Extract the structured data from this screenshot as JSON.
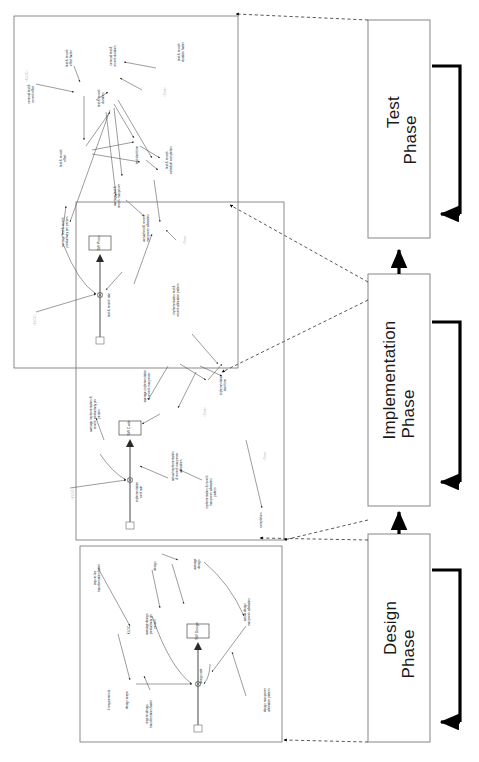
{
  "diagram": {
    "orientation": "rotated-90-ccw"
  },
  "phases": [
    {
      "id": "test",
      "line1": "Test",
      "line2": "Phase"
    },
    {
      "id": "implementation",
      "line1": "Implementation",
      "line2": "Phase"
    },
    {
      "id": "design",
      "line1": "Design",
      "line2": "Phase"
    }
  ],
  "stocks": [
    {
      "id": "sw-proto",
      "label": "SW Proto"
    },
    {
      "id": "sw-code",
      "label": "SW Code"
    },
    {
      "id": "sw-design",
      "label": "SW Design"
    }
  ],
  "test_phase": {
    "variables": [
      {
        "id": "t1",
        "label": "nominal test &",
        "label2": "rework effort",
        "shadow": false
      },
      {
        "id": "t2",
        "label": "test & rework",
        "label2": "effort factor",
        "shadow": false
      },
      {
        "id": "t3",
        "label": "nominal test &",
        "label2": "rework duration",
        "shadow": false
      },
      {
        "id": "t4",
        "label": "test & rework",
        "label2": "duration factor",
        "shadow": false
      },
      {
        "id": "t5",
        "label": "test & rework",
        "label2": "duration",
        "shadow": false
      },
      {
        "id": "t6",
        "label": "test & rework",
        "label2": "effort",
        "shadow": false
      },
      {
        "id": "t7",
        "label": "test start time",
        "label2": "",
        "shadow": false
      },
      {
        "id": "t8",
        "label": "test & rework",
        "label2": "schedule completion",
        "shadow": false
      },
      {
        "id": "t9",
        "label": "average test &",
        "label2": "rework manpower",
        "shadow": false
      },
      {
        "id": "t10",
        "label": "average test & rework",
        "label2": "productivity per person",
        "shadow": false
      },
      {
        "id": "t11",
        "label": "test & rework rate",
        "label2": "",
        "shadow": false
      },
      {
        "id": "t12",
        "label": "actual test & rework",
        "label2": "manpower allocation",
        "shadow": false
      },
      {
        "id": "t13",
        "label": "implementation test &",
        "label2": "rework allocation pattern",
        "shadow": false
      },
      {
        "id": "t14",
        "label": "<KLOC>",
        "label2": "",
        "shadow": true
      },
      {
        "id": "t15",
        "label": "<Time>",
        "label2": "",
        "shadow": true
      },
      {
        "id": "t16",
        "label": "<KLOC>",
        "label2": "",
        "shadow": true
      },
      {
        "id": "t17",
        "label": "<Time>",
        "label2": "",
        "shadow": true
      }
    ]
  },
  "implementation_phase": {
    "variables": [
      {
        "id": "i1",
        "label": "average implementation &",
        "label2": "rework productivity per",
        "label3": "person",
        "shadow": false
      },
      {
        "id": "i2",
        "label": "average implementation",
        "label2": "& rework manpower",
        "shadow": false
      },
      {
        "id": "i3",
        "label": "implementation",
        "label2": "work rate",
        "shadow": false
      },
      {
        "id": "i4",
        "label": "actual implementation",
        "label2": "& rework manpower",
        "label3": "allocation",
        "shadow": false
      },
      {
        "id": "i5",
        "label": "implementation & rework",
        "label2": "manpower allocation",
        "label3": "pattern",
        "shadow": false
      },
      {
        "id": "i6",
        "label": "implementation",
        "label2": "start time",
        "shadow": false
      },
      {
        "id": "i7",
        "label": "completion",
        "label2": "",
        "shadow": false
      },
      {
        "id": "i8",
        "label": "<KLOC>",
        "label2": "",
        "shadow": true
      },
      {
        "id": "i9",
        "label": "<Time>",
        "label2": "",
        "shadow": true
      },
      {
        "id": "i10",
        "label": "<Time>",
        "label2": "",
        "shadow": true
      }
    ]
  },
  "design_phase": {
    "variables": [
      {
        "id": "d1",
        "label": "# requirements",
        "label2": "",
        "shadow": false
      },
      {
        "id": "d2",
        "label": "reqs-to-loc",
        "label2": "transformation factor",
        "shadow": false
      },
      {
        "id": "d3",
        "label": "KLOC",
        "label2": "",
        "shadow": false
      },
      {
        "id": "d4",
        "label": "average design",
        "label2": "productivity per",
        "label3": "person",
        "shadow": false
      },
      {
        "id": "d5",
        "label": "design rate",
        "label2": "",
        "shadow": false
      },
      {
        "id": "d6",
        "label": "design scope",
        "label2": "",
        "shadow": false
      },
      {
        "id": "d7",
        "label": "reqs-to-design",
        "label2": "transformation factor",
        "shadow": false
      },
      {
        "id": "d8",
        "label": "actual design",
        "label2": "manpower allocation",
        "shadow": false
      },
      {
        "id": "d9",
        "label": "design manpower",
        "label2": "allocation pattern",
        "shadow": false
      },
      {
        "id": "d10",
        "label": "design",
        "label2": "rate",
        "shadow": false
      },
      {
        "id": "d11",
        "label": "average",
        "label2": "design",
        "shadow": false
      }
    ]
  }
}
